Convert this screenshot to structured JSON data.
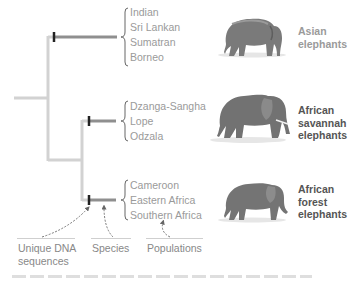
{
  "diagram": {
    "type": "phylogenetic-tree",
    "colors": {
      "tree_line": "#d2d2d2",
      "branch_bar": "#8f8f8f",
      "node_tick": "#222222",
      "population_text": "#9a9a9a",
      "asian_label": "#9a9a9a",
      "african_label": "#555555",
      "legend_text": "#888888"
    },
    "groups": [
      {
        "id": "asian",
        "label_lines": [
          "Asian",
          "elephants"
        ],
        "populations": [
          "Indian",
          "Sri Lankan",
          "Sumatran",
          "Borneo"
        ],
        "image": "asian-elephant"
      },
      {
        "id": "african-savannah",
        "label_lines": [
          "African",
          "savannah",
          "elephants"
        ],
        "populations": [
          "Dzanga-Sangha",
          "Lope",
          "Odzala"
        ],
        "image": "african-savannah-elephant"
      },
      {
        "id": "african-forest",
        "label_lines": [
          "African",
          "forest",
          "elephants"
        ],
        "populations": [
          "Cameroon",
          "Eastern Africa",
          "Southern Africa"
        ],
        "image": "african-forest-elephant"
      }
    ],
    "legend": {
      "unique_dna": [
        "Unique DNA",
        "sequences"
      ],
      "species": "Species",
      "populations": "Populations"
    }
  }
}
